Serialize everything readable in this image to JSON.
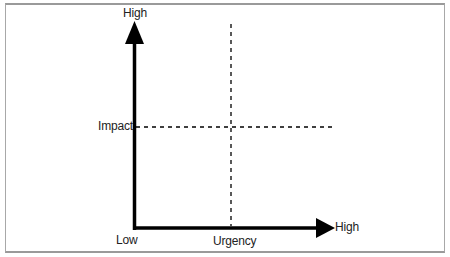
{
  "diagram": {
    "y_axis": {
      "label": "Impact",
      "high_label": "High",
      "low_label": "Low"
    },
    "x_axis": {
      "label": "Urgency",
      "high_label": "High"
    },
    "colors": {
      "axis": "#000000",
      "divider": "#000000",
      "frame": "#a8a8a8",
      "background": "#ffffff"
    }
  }
}
